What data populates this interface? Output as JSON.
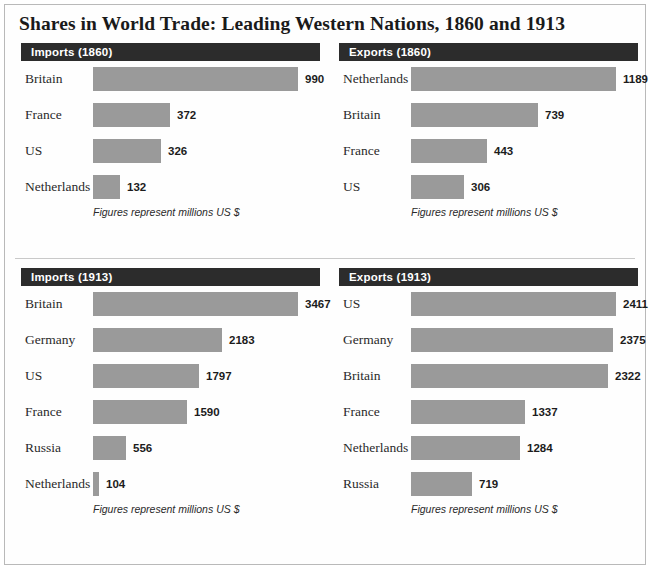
{
  "title": "Shares in World Trade: Leading Western Nations, 1860 and 1913",
  "footnote": "Figures represent millions US $",
  "colors": {
    "header_bar": "#2c2c2c",
    "bar_fill": "#9a9a9a",
    "page_background": "#ffffff",
    "frame_border": "#b9b9b9",
    "title_text": "#1a1a1a",
    "header_text": "#ffffff"
  },
  "panels": {
    "imports_1860": {
      "header": "Imports (1860)"
    },
    "exports_1860": {
      "header": "Exports (1860)"
    },
    "imports_1913": {
      "header": "Imports (1913)"
    },
    "exports_1913": {
      "header": "Exports (1913)"
    }
  },
  "chart_data": [
    {
      "type": "bar",
      "title": "Imports (1860)",
      "orientation": "horizontal",
      "categories": [
        "Britain",
        "France",
        "US",
        "Netherlands"
      ],
      "values": [
        990,
        372,
        326,
        132
      ],
      "xlabel": "",
      "ylabel": "",
      "xlim": [
        0,
        990
      ],
      "unit": "millions US $",
      "annotation": "Figures represent millions US $",
      "grid": false,
      "legend": "none"
    },
    {
      "type": "bar",
      "title": "Exports (1860)",
      "orientation": "horizontal",
      "categories": [
        "Netherlands",
        "Britain",
        "France",
        "US"
      ],
      "values": [
        1189,
        739,
        443,
        306
      ],
      "xlabel": "",
      "ylabel": "",
      "xlim": [
        0,
        1189
      ],
      "unit": "millions US $",
      "annotation": "Figures represent millions US $",
      "grid": false,
      "legend": "none"
    },
    {
      "type": "bar",
      "title": "Imports (1913)",
      "orientation": "horizontal",
      "categories": [
        "Britain",
        "Germany",
        "US",
        "France",
        "Russia",
        "Netherlands"
      ],
      "values": [
        3467,
        2183,
        1797,
        1590,
        556,
        104
      ],
      "xlabel": "",
      "ylabel": "",
      "xlim": [
        0,
        3467
      ],
      "unit": "millions US $",
      "annotation": "Figures represent millions US $",
      "grid": false,
      "legend": "none"
    },
    {
      "type": "bar",
      "title": "Exports (1913)",
      "orientation": "horizontal",
      "categories": [
        "US",
        "Germany",
        "Britain",
        "France",
        "Netherlands",
        "Russia"
      ],
      "values": [
        2411,
        2375,
        2322,
        1337,
        1284,
        719
      ],
      "xlabel": "",
      "ylabel": "",
      "xlim": [
        0,
        2411
      ],
      "unit": "millions US $",
      "annotation": "Figures represent millions US $",
      "grid": false,
      "legend": "none"
    }
  ]
}
